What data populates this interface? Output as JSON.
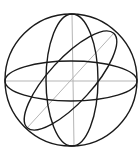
{
  "diagram": {
    "title": "",
    "colors": {
      "background": "#ffffff",
      "stroke": "#1a1a1a",
      "axis": "#b5b5b5"
    },
    "sphere": {
      "cx": 71,
      "cy": 80,
      "r": 66
    },
    "great_circles": [
      {
        "name": "equator",
        "cx": 71,
        "cy": 81,
        "rx": 66,
        "ry": 20,
        "rotate": 0
      },
      {
        "name": "meridian-vertical",
        "cx": 72,
        "cy": 80,
        "rx": 26,
        "ry": 66,
        "rotate": 0
      },
      {
        "name": "meridian-tilted",
        "cx": 70.5,
        "cy": 80.5,
        "rx": 64,
        "ry": 22,
        "rotate": -47.5
      }
    ],
    "axes": [
      {
        "name": "horizontal-axis",
        "x1": 5,
        "y1": 81,
        "x2": 137,
        "y2": 81
      },
      {
        "name": "vertical-axis",
        "x1": 72,
        "y1": 14,
        "x2": 74,
        "y2": 146
      },
      {
        "name": "diagonal-axis",
        "x1": 27,
        "y1": 128,
        "x2": 114,
        "y2": 33
      }
    ]
  }
}
